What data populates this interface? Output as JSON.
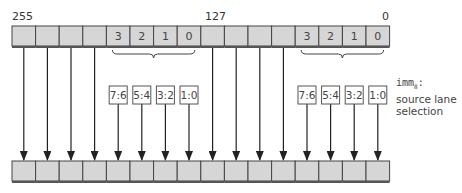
{
  "diagram": {
    "bit_labels": {
      "high": "255",
      "mid": "127",
      "low": "0"
    },
    "source_register": {
      "cells": [
        "",
        "",
        "",
        "",
        "3",
        "2",
        "1",
        "0",
        "",
        "",
        "",
        "",
        "3",
        "2",
        "1",
        "0"
      ]
    },
    "selectors": {
      "left": [
        "7:6",
        "5:4",
        "3:2",
        "1:0"
      ],
      "right": [
        "7:6",
        "5:4",
        "3:2",
        "1:0"
      ]
    },
    "annotation": {
      "imm_name": "imm",
      "imm_sub": "8",
      "imm_suffix": ":",
      "line2": "source lane",
      "line3": "selection"
    },
    "destination_register": {
      "cell_count": 16
    },
    "colors": {
      "cell_fill": "#d6d6d6",
      "cell_border": "#444444",
      "line": "#222222"
    }
  }
}
